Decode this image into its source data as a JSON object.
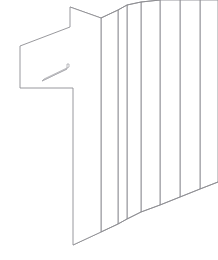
{
  "artwork": {
    "title": "Extruded numeral one wireframe",
    "subject": "1",
    "style": "line-art perspective wireframe",
    "background_color": "#ffffff",
    "stroke_color": "#8d8d92",
    "stroke_color_light": "#a8a8ad",
    "stroke_width": 0.9,
    "canvas": {
      "width": 218,
      "height": 260
    },
    "slice_count": 7,
    "description": "A numeral 1 drawn as an outline and repeated as a series of thin flat panels receding toward the upper right, suggesting an extrusion in perspective."
  },
  "shapes": {
    "front_face": {
      "name": "front-face-numeral-one",
      "points": "20,46 70,27 70,7 101,18 101,232 73,245 73,88 20,88"
    },
    "front_face_top_edge": {
      "name": "front-face-top-edge",
      "points": "20,46 70,27"
    },
    "slot_detail": {
      "name": "slot-detail",
      "points": "42,81 67,69 67,64 69,64 69,67 44,79"
    },
    "slot_inner_line": {
      "name": "slot-inner-line",
      "points": "42,81 67,69"
    },
    "slices": [
      {
        "name": "slice-1",
        "top_x": 101,
        "top_y": 18,
        "bottom_x": 101,
        "bottom_y": 232,
        "back_top_x": 118,
        "back_top_y": 10,
        "back_bottom_x": 118,
        "back_bottom_y": 224
      },
      {
        "name": "slice-2",
        "top_x": 118,
        "top_y": 10,
        "bottom_x": 118,
        "bottom_y": 224,
        "back_top_x": 127,
        "back_top_y": 5,
        "back_bottom_x": 127,
        "back_bottom_y": 219
      },
      {
        "name": "slice-3",
        "top_x": 127,
        "top_y": 5,
        "bottom_x": 127,
        "bottom_y": 219,
        "back_top_x": 141,
        "back_top_y": 2,
        "back_bottom_x": 141,
        "back_bottom_y": 212
      },
      {
        "name": "slice-4",
        "top_x": 141,
        "top_y": 2,
        "bottom_x": 141,
        "bottom_y": 212,
        "back_top_x": 160,
        "back_top_y": 0,
        "back_bottom_x": 160,
        "back_bottom_y": 205
      },
      {
        "name": "slice-5",
        "top_x": 160,
        "top_y": 0,
        "bottom_x": 160,
        "bottom_y": 205,
        "back_top_x": 180,
        "back_top_y": 0,
        "back_bottom_x": 180,
        "back_bottom_y": 197
      },
      {
        "name": "slice-6",
        "top_x": 180,
        "top_y": 0,
        "bottom_x": 180,
        "bottom_y": 197,
        "back_top_x": 200,
        "back_top_y": 0,
        "back_bottom_x": 200,
        "back_bottom_y": 189
      },
      {
        "name": "slice-7",
        "top_x": 200,
        "top_y": 0,
        "bottom_x": 200,
        "bottom_y": 189,
        "back_top_x": 218,
        "back_top_y": 0,
        "back_bottom_x": 218,
        "back_bottom_y": 182
      }
    ],
    "bottom_edges": [
      {
        "name": "bottom-edge-front",
        "points": "73,245 101,232"
      },
      {
        "name": "bottom-edge-1",
        "points": "101,232 118,224"
      },
      {
        "name": "bottom-edge-2",
        "points": "118,224 127,219"
      },
      {
        "name": "bottom-edge-3",
        "points": "127,219 141,212"
      },
      {
        "name": "bottom-edge-4",
        "points": "141,212 160,205"
      },
      {
        "name": "bottom-edge-5",
        "points": "160,205 180,197"
      },
      {
        "name": "bottom-edge-6",
        "points": "180,197 200,189"
      },
      {
        "name": "bottom-edge-7",
        "points": "200,189 218,182"
      }
    ],
    "top_edges": [
      {
        "name": "top-edge-1",
        "points": "70,7 101,18"
      },
      {
        "name": "top-edge-2",
        "points": "101,18 118,10"
      },
      {
        "name": "top-edge-3",
        "points": "118,10 127,5"
      },
      {
        "name": "top-edge-4",
        "points": "127,5 141,2"
      },
      {
        "name": "top-edge-5",
        "points": "141,2 160,0"
      }
    ],
    "shoulder_edges": [
      {
        "name": "shoulder-edge-1",
        "points": "70,27 101,18"
      },
      {
        "name": "shoulder-edge-2",
        "points": "101,18 118,10"
      }
    ],
    "stem_inner_edges": [
      {
        "name": "stem-inner-left",
        "points": "73,88 73,245"
      },
      {
        "name": "stem-inner-right",
        "points": "101,18 101,232"
      }
    ]
  }
}
